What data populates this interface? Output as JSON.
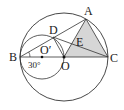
{
  "diagram": {
    "type": "geometry",
    "labels": {
      "A": "A",
      "B": "B",
      "C": "C",
      "D": "D",
      "E": "E",
      "O": "O",
      "O_prime": "O′",
      "angle": "30°"
    },
    "colors": {
      "stroke": "#333333",
      "shade": "#d6d6d6",
      "background": "#ffffff"
    }
  }
}
